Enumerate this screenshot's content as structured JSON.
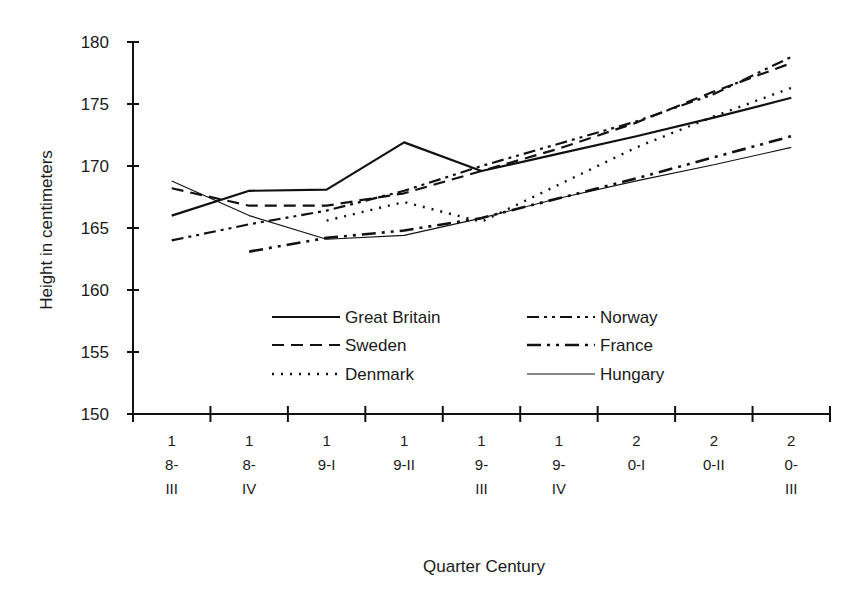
{
  "chart_data": {
    "type": "line",
    "title": "",
    "xlabel": "Quarter Century",
    "ylabel": "Height in centimeters",
    "ylim": [
      150,
      180
    ],
    "yticks": [
      150,
      155,
      160,
      165,
      170,
      175,
      180
    ],
    "grid": false,
    "legend_position": "inside-lower-center",
    "categories": [
      "18-III",
      "18-IV",
      "19-I",
      "19-II",
      "19-III",
      "19-IV",
      "20-I",
      "20-II",
      "20-III"
    ],
    "category_label_lines": [
      [
        "1",
        "8-",
        "III"
      ],
      [
        "1",
        "8-",
        "IV"
      ],
      [
        "1",
        "9-I",
        ""
      ],
      [
        "1",
        "9-II",
        ""
      ],
      [
        "1",
        "9-",
        "III"
      ],
      [
        "1",
        "9-",
        "IV"
      ],
      [
        "2",
        "0-I",
        ""
      ],
      [
        "2",
        "0-II",
        ""
      ],
      [
        "2",
        "0-",
        "III"
      ]
    ],
    "series": [
      {
        "name": "Great Britain",
        "style": "solid-thick",
        "values": [
          166.0,
          168.0,
          168.1,
          171.9,
          169.6,
          171.0,
          172.4,
          173.9,
          175.5
        ]
      },
      {
        "name": "Sweden",
        "style": "dashed",
        "values": [
          168.2,
          166.8,
          166.8,
          167.8,
          169.6,
          171.4,
          173.5,
          176.0,
          178.3
        ]
      },
      {
        "name": "Denmark",
        "style": "dotted",
        "values": [
          null,
          null,
          165.6,
          167.1,
          165.5,
          168.5,
          171.5,
          174.0,
          176.3
        ]
      },
      {
        "name": "Norway",
        "style": "dash-dot-dot",
        "values": [
          164.0,
          165.3,
          166.4,
          168.0,
          170.0,
          171.8,
          173.6,
          175.8,
          178.8
        ]
      },
      {
        "name": "France",
        "style": "dash-dot-dot-thick",
        "values": [
          null,
          163.1,
          164.2,
          164.8,
          165.8,
          167.4,
          169.0,
          170.7,
          172.4
        ]
      },
      {
        "name": "Hungary",
        "style": "solid-thin",
        "values": [
          168.8,
          166.0,
          164.1,
          164.4,
          165.8,
          167.4,
          168.8,
          170.1,
          171.5
        ]
      }
    ]
  }
}
